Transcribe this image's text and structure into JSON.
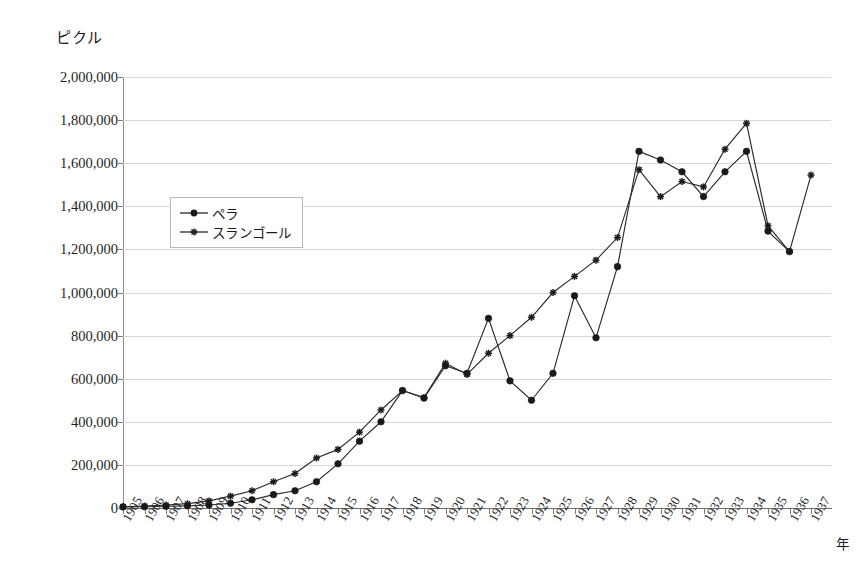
{
  "chart_data": {
    "type": "line",
    "title": "",
    "xlabel": "年",
    "ylabel": "ピクル",
    "ylim": [
      0,
      2000000
    ],
    "ytick_step": 200000,
    "grid": "horizontal",
    "legend_position": "upper-left-inside",
    "x": [
      1905,
      1906,
      1907,
      1908,
      1909,
      1910,
      1911,
      1912,
      1913,
      1914,
      1915,
      1916,
      1917,
      1918,
      1919,
      1920,
      1921,
      1922,
      1923,
      1924,
      1925,
      1926,
      1927,
      1928,
      1929,
      1930,
      1931,
      1932,
      1933,
      1934,
      1935,
      1936,
      1937
    ],
    "xtick_labels": [
      "1905",
      "1906",
      "1907",
      "1908",
      "1909",
      "1910",
      "1911",
      "1912",
      "1913",
      "1914",
      "1915",
      "1916",
      "1917",
      "1918",
      "1919",
      "1920",
      "1921",
      "1922",
      "1923",
      "1924",
      "1925",
      "1926",
      "1927",
      "1928",
      "1929",
      "1930",
      "1931",
      "1932",
      "1933",
      "1934",
      "1935",
      "1936",
      "1937"
    ],
    "ytick_labels": [
      "0",
      "200,000",
      "400,000",
      "600,000",
      "800,000",
      "1,000,000",
      "1,200,000",
      "1,400,000",
      "1,600,000",
      "1,800,000",
      "2,000,000"
    ],
    "ytick_values": [
      0,
      200000,
      400000,
      600000,
      800000,
      1000000,
      1200000,
      1400000,
      1600000,
      1800000,
      2000000
    ],
    "series": [
      {
        "name": "ペラ",
        "marker": "circle",
        "color": "#1a1a1a",
        "values": [
          5000,
          6000,
          8000,
          10000,
          14000,
          22000,
          38000,
          62000,
          80000,
          122000,
          205000,
          310000,
          400000,
          545000,
          510000,
          660000,
          625000,
          880000,
          590000,
          500000,
          625000,
          985000,
          790000,
          1120000,
          1655000,
          1615000,
          1560000,
          1445000,
          1560000,
          1655000,
          1285000,
          1190000,
          null
        ]
      },
      {
        "name": "スランゴール",
        "marker": "star",
        "color": "#1a1a1a",
        "values": [
          6000,
          9000,
          14000,
          20000,
          33000,
          55000,
          80000,
          122000,
          160000,
          232000,
          272000,
          352000,
          455000,
          545000,
          512000,
          672000,
          620000,
          718000,
          800000,
          885000,
          1000000,
          1075000,
          1150000,
          1255000,
          1570000,
          1445000,
          1515000,
          1490000,
          1665000,
          1785000,
          1310000,
          1190000,
          1545000
        ]
      }
    ]
  },
  "legend": {
    "items": [
      {
        "label": "ペラ",
        "marker": "circle"
      },
      {
        "label": "スランゴール",
        "marker": "star"
      }
    ]
  },
  "axes": {
    "y_unit_caption": "ピクル",
    "x_caption": "年"
  }
}
